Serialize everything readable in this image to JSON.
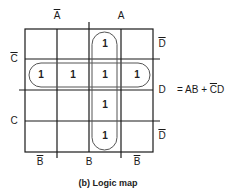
{
  "caption": "(b) Logic map",
  "equation": {
    "prefix": "= AB + ",
    "c_bar": "C",
    "suffix": "D"
  },
  "column_labels": {
    "top": [
      {
        "text": "A",
        "overline": true
      },
      {
        "text": "A",
        "overline": false
      }
    ],
    "bottom": [
      {
        "text": "B",
        "overline": true
      },
      {
        "text": "B",
        "overline": false
      },
      {
        "text": "B",
        "overline": true
      }
    ]
  },
  "row_labels": {
    "left": [
      {
        "text": "C",
        "overline": true
      },
      {
        "text": "C",
        "overline": false
      }
    ],
    "right": [
      {
        "text": "D",
        "overline": true
      },
      {
        "text": "D",
        "overline": false
      },
      {
        "text": "D",
        "overline": true
      }
    ]
  },
  "grid": {
    "rows": 4,
    "cols": 4,
    "cells": [
      [
        "",
        "",
        "1",
        ""
      ],
      [
        "1",
        "1",
        "1",
        "1"
      ],
      [
        "",
        "",
        "1",
        ""
      ],
      [
        "",
        "",
        "1",
        ""
      ]
    ]
  },
  "groupings": [
    {
      "name": "AB",
      "orientation": "vertical",
      "column": 3,
      "rows": [
        1,
        4
      ]
    },
    {
      "name": "C̄D",
      "orientation": "horizontal",
      "row": 2,
      "columns": [
        1,
        4
      ]
    }
  ],
  "colors": {
    "line": "#1a1a1a",
    "loop": "#555555"
  }
}
